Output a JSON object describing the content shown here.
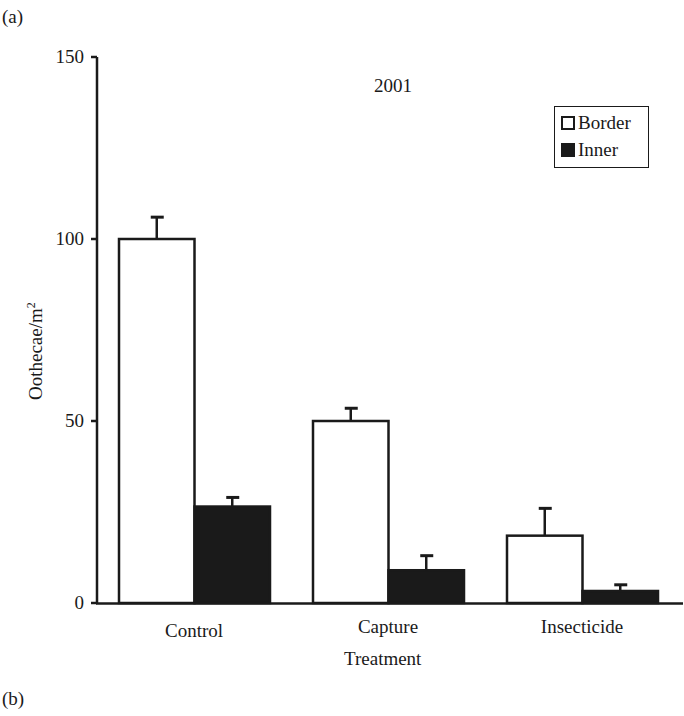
{
  "panel_labels": {
    "top": "(a)",
    "bottom": "(b)"
  },
  "chart_data": {
    "type": "bar",
    "title": "2001",
    "xlabel": "Treatment",
    "ylabel": "Oothecae/m",
    "ylabel_superscript": "2",
    "categories": [
      "Control",
      "Capture",
      "Insecticide"
    ],
    "series": [
      {
        "name": "Border",
        "color": "#ffffff",
        "values": [
          100,
          50,
          18.5
        ],
        "error_upper": [
          106,
          53.5,
          26
        ]
      },
      {
        "name": "Inner",
        "color": "#1a1a1a",
        "values": [
          26.5,
          9,
          3.3
        ],
        "error_upper": [
          29,
          13,
          5
        ]
      }
    ],
    "ylim": [
      0,
      150
    ],
    "yticks": [
      0,
      50,
      100,
      150
    ],
    "grid": false,
    "legend_position": "upper right",
    "error_bars": "upper only (SE)"
  },
  "axis": {
    "ytick_labels": [
      "150",
      "100",
      "50",
      "0"
    ]
  },
  "legend": {
    "items": [
      {
        "label": "Border",
        "style": "open"
      },
      {
        "label": "Inner",
        "style": "filled"
      }
    ]
  }
}
